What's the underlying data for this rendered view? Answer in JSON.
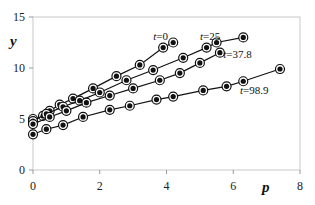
{
  "chart_data": {
    "type": "line",
    "title": "",
    "xlabel": "p",
    "ylabel": "y",
    "xlim": [
      0,
      8
    ],
    "ylim": [
      0,
      15
    ],
    "xticks": [
      "0",
      "2",
      "4",
      "6",
      "8"
    ],
    "yticks": [
      "0",
      "5",
      "10",
      "15"
    ],
    "grid": false,
    "legend": "inline labels",
    "series": [
      {
        "name": "t=0",
        "x": [
          0,
          0.3,
          0.5,
          0.8,
          1.2,
          1.8,
          2.5,
          3.2,
          3.9,
          4.2
        ],
        "y": [
          5.0,
          5.3,
          5.8,
          6.4,
          7.0,
          8.0,
          9.2,
          10.3,
          12.0,
          12.5
        ]
      },
      {
        "name": "t=25",
        "x": [
          0,
          0.4,
          0.9,
          1.4,
          2.0,
          2.8,
          3.6,
          4.5,
          5.2,
          5.5,
          6.3
        ],
        "y": [
          4.8,
          5.5,
          6.2,
          6.8,
          7.6,
          8.8,
          9.8,
          11.0,
          12.0,
          12.5,
          13.0
        ]
      },
      {
        "name": "t=37.8",
        "x": [
          0,
          0.5,
          1.0,
          1.6,
          2.3,
          3.0,
          3.8,
          4.4,
          5.0,
          5.6
        ],
        "y": [
          4.5,
          5.2,
          5.8,
          6.6,
          7.3,
          8.0,
          8.8,
          9.5,
          10.5,
          11.5
        ]
      },
      {
        "name": "t=98.9",
        "x": [
          0,
          0.4,
          0.9,
          1.5,
          2.3,
          2.9,
          3.7,
          4.2,
          5.1,
          5.8,
          6.3,
          7.4
        ],
        "y": [
          3.5,
          4.0,
          4.4,
          5.2,
          5.9,
          6.3,
          6.9,
          7.2,
          7.8,
          8.2,
          8.7,
          9.9
        ]
      }
    ],
    "annotations": [
      {
        "text": "t=0",
        "x": 3.6,
        "y": 12.7
      },
      {
        "text": "t=25",
        "x": 5.0,
        "y": 12.7
      },
      {
        "text": "t=37.8",
        "x": 5.7,
        "y": 11.0
      },
      {
        "text": "t=98.9",
        "x": 6.2,
        "y": 7.5
      }
    ]
  }
}
